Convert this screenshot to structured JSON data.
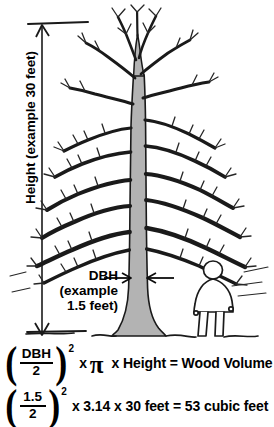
{
  "diagram": {
    "height_label": "Height (example 30 feet)",
    "dbh_label": {
      "line1": "DBH",
      "line2": "(example",
      "line3": "1.5 feet)"
    },
    "elements": {
      "tree": "bare-deciduous-tree",
      "person": "human-figure-for-scale",
      "ground": "ground-line",
      "height_arrow": "vertical-double-arrow",
      "dbh_arrows": "horizontal-inward-arrows"
    },
    "colors": {
      "trunk_fill": "#b3b3b3",
      "outline": "#1a1a1a",
      "background": "#ffffff",
      "text": "#000000"
    }
  },
  "formulas": [
    {
      "id": "general-formula",
      "numerator": "DBH",
      "denominator": "2",
      "exponent": "2",
      "rest": "x",
      "pi_symbol": "π",
      "tail": "x Height = Wood Volume",
      "full_text": "(DBH/2)² x π x Height = Wood Volume"
    },
    {
      "id": "example-formula",
      "numerator": "1.5",
      "denominator": "2",
      "exponent": "2",
      "rest": "x 3.14 x 30 feet = 53 cubic feet",
      "full_text": "(1.5/2)² x 3.14 x 30 feet = 53 cubic feet"
    }
  ],
  "values": {
    "example_height_feet": "30",
    "example_dbh_feet": "1.5",
    "pi": "3.14",
    "result_cubic_feet": "53"
  },
  "parens": {
    "open": "(",
    "close": ")"
  }
}
